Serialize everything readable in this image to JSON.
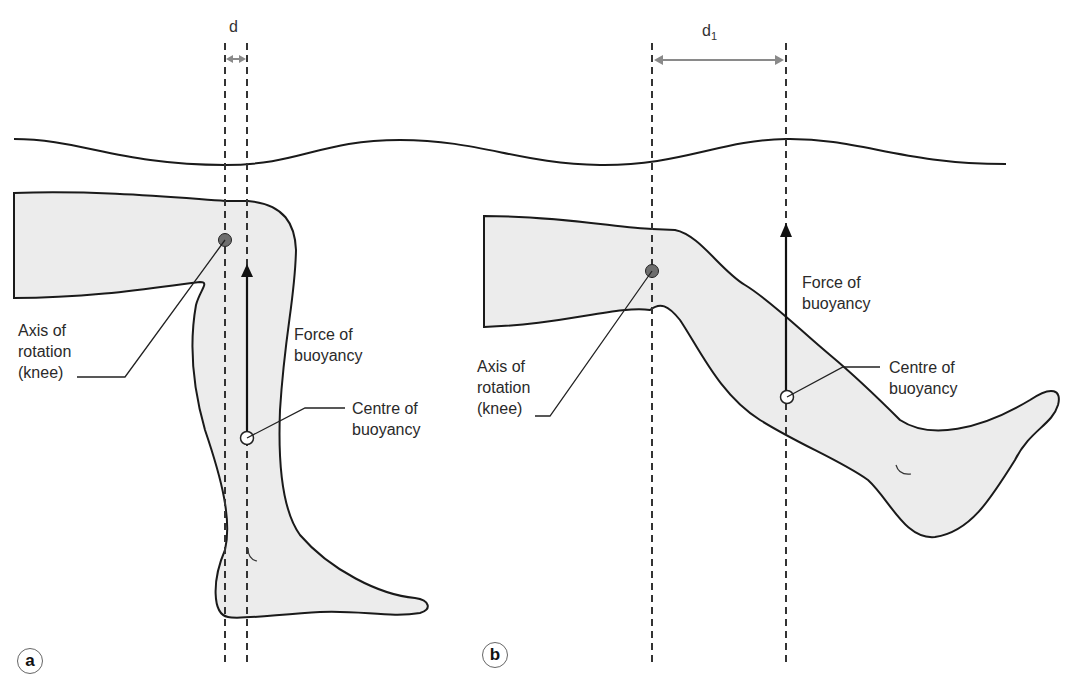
{
  "panels": [
    {
      "id": "a",
      "badge": "a",
      "distance_label": "d",
      "labels": {
        "axis": "Axis of\nrotation\n(knee) ",
        "force": "Force of\nbuoyancy",
        "centre": "Centre of\nbuoyancy"
      }
    },
    {
      "id": "b",
      "badge": "b",
      "distance_label": "d",
      "distance_subscript": "1",
      "labels": {
        "axis": "Axis of\nrotation\n(knee) ",
        "force": "Force of\nbuoyancy",
        "centre": "Centre of\nbuoyancy"
      }
    }
  ],
  "colors": {
    "leg_fill": "#ececec",
    "outline": "#1a1a1a",
    "knee_dot": "#6e6e6e",
    "dimension_arrow": "#8a8a8a"
  }
}
